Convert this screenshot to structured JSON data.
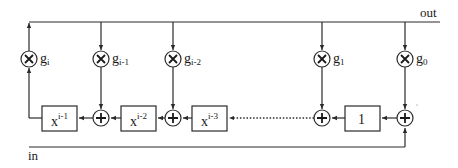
{
  "diagram": {
    "type": "LFSR / polynomial division circuit",
    "colors": {
      "ink": "#2a2a2a",
      "background": "#ffffff"
    },
    "labels": {
      "out": "out",
      "in": "in"
    },
    "multipliers": [
      {
        "id": "gi",
        "base": "g",
        "sub": "i"
      },
      {
        "id": "gi1",
        "base": "g",
        "sub": "i-1"
      },
      {
        "id": "gi2",
        "base": "g",
        "sub": "i-2"
      },
      {
        "id": "g1",
        "base": "g",
        "sub": "1"
      },
      {
        "id": "g0",
        "base": "g",
        "sub": "0"
      }
    ],
    "delay_boxes": [
      {
        "id": "xi1",
        "base": "x",
        "sup": "i-1"
      },
      {
        "id": "xi2",
        "base": "x",
        "sup": "i-2"
      },
      {
        "id": "xi3",
        "base": "x",
        "sup": "i-3"
      },
      {
        "id": "one",
        "base": "1",
        "sup": ""
      }
    ],
    "adders": [
      "plus-1",
      "plus-2",
      "plus-3",
      "plus-4"
    ],
    "symbols": {
      "multiply": "×",
      "add": "+"
    }
  }
}
